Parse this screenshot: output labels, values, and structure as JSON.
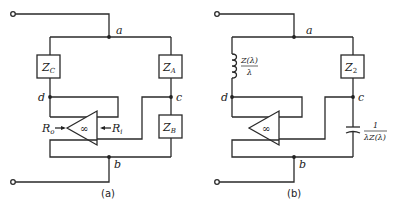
{
  "figure": {
    "panels": [
      {
        "caption": "(a)",
        "nodes": {
          "a": "a",
          "b": "b",
          "c": "c",
          "d": "d"
        },
        "components": {
          "zc": "Z",
          "zc_sub": "C",
          "za": "Z",
          "za_sub": "A",
          "zb": "Z",
          "zb_sub": "B",
          "amp": "∞",
          "ro": "R",
          "ro_sub": "o",
          "ri": "R",
          "ri_sub": "i"
        }
      },
      {
        "caption": "(b)",
        "nodes": {
          "a": "a",
          "b": "b",
          "c": "c",
          "d": "d"
        },
        "components": {
          "inductor_num": "Z(λ)",
          "inductor_den": "λ",
          "z2": "Z",
          "z2_sub": "2",
          "amp": "∞",
          "cap_num": "1",
          "cap_den": "λZ(λ)"
        }
      }
    ]
  }
}
